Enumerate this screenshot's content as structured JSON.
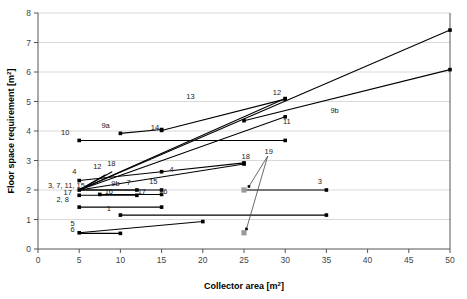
{
  "chart_data": {
    "type": "line",
    "title": "",
    "xlabel": "Collector area [m2]",
    "ylabel": "Floor space requirement [m2]",
    "xlabel_base": "Collector area [m",
    "xlabel_sup": "2",
    "xlabel_tail": "]",
    "ylabel_base": "Floor space requirement [m",
    "ylabel_sup": "2",
    "ylabel_tail": "]",
    "xlim": [
      0,
      50
    ],
    "ylim": [
      0,
      8
    ],
    "xticks": [
      0,
      5,
      10,
      15,
      20,
      25,
      30,
      35,
      40,
      45,
      50
    ],
    "yticks": [
      0,
      1,
      2,
      3,
      4,
      5,
      6,
      7,
      8
    ],
    "grid": "horizontal",
    "legend": "none",
    "marker_color": "#000000",
    "gray_marker_color": "#9a9a9a",
    "line_color": "#000000",
    "grid_color": "#d9d9d9",
    "series": [
      {
        "name": "1",
        "points": [
          [
            10,
            1.15
          ],
          [
            35,
            1.15
          ]
        ],
        "label": "1",
        "label_x": 8.6,
        "label_y": 1.3
      },
      {
        "name": "2, 8",
        "points": [
          [
            5,
            1.42
          ],
          [
            15,
            1.42
          ]
        ],
        "label": "2, 8",
        "label_x": 3.0,
        "label_y": 1.58
      },
      {
        "name": "3",
        "points": [
          [
            25,
            2.0
          ],
          [
            35,
            2.0
          ]
        ],
        "label": "3",
        "label_x": 34.2,
        "label_y": 2.22
      },
      {
        "name": "4a",
        "points": [
          [
            5,
            2.32
          ],
          [
            15,
            2.62
          ]
        ],
        "label": "4",
        "label_x": 4.4,
        "label_y": 2.55
      },
      {
        "name": "4b",
        "points": [
          [
            15,
            2.62
          ],
          [
            25,
            2.92
          ]
        ],
        "label": "4",
        "label_x": 16.2,
        "label_y": 2.62
      },
      {
        "name": "5",
        "points": [
          [
            5,
            0.55
          ],
          [
            20,
            0.93
          ]
        ],
        "label": "5",
        "label_x": 4.2,
        "label_y": 0.78
      },
      {
        "name": "6",
        "points": [
          [
            5,
            0.53
          ],
          [
            10,
            0.53
          ]
        ],
        "label": "6",
        "label_x": 4.2,
        "label_y": 0.58
      },
      {
        "name": "7",
        "points": [
          [
            5,
            2.0
          ],
          [
            12,
            2.0
          ]
        ],
        "label": "7",
        "label_x": 11.0,
        "label_y": 2.16
      },
      {
        "name": "9a",
        "points": [
          [
            10,
            3.92
          ],
          [
            15,
            4.05
          ]
        ],
        "label": "9a",
        "label_x": 8.2,
        "label_y": 4.1
      },
      {
        "name": "9b",
        "points": [
          [
            25,
            4.35
          ],
          [
            50,
            6.08
          ]
        ],
        "label": "9b",
        "label_x": 36.0,
        "label_y": 4.62
      },
      {
        "name": "10",
        "points": [
          [
            5,
            3.68
          ],
          [
            30,
            3.68
          ]
        ],
        "label": "10",
        "label_x": 3.3,
        "label_y": 3.86
      },
      {
        "name": "11",
        "points": [
          [
            5,
            2.0
          ],
          [
            30,
            4.48
          ]
        ],
        "label": "11",
        "label_x": 30.2,
        "label_y": 4.25
      },
      {
        "name": "12",
        "points": [
          [
            5,
            2.0
          ],
          [
            30,
            5.1
          ]
        ],
        "label": "12",
        "label_x": 29.0,
        "label_y": 5.22
      },
      {
        "name": "12b",
        "points": [
          [
            5,
            2.0
          ],
          [
            8.2,
            2.52
          ]
        ],
        "label": "12",
        "label_x": 7.2,
        "label_y": 2.72
      },
      {
        "name": "13",
        "points": [
          [
            5,
            2.0
          ],
          [
            50,
            7.42
          ]
        ],
        "label": "13",
        "label_x": 18.5,
        "label_y": 5.1
      },
      {
        "name": "14",
        "points": [
          [
            15,
            4.02
          ],
          [
            30,
            5.08
          ]
        ],
        "label": "14",
        "label_x": 14.2,
        "label_y": 4.02
      },
      {
        "name": "15",
        "points": [
          [
            5,
            2.0
          ],
          [
            15,
            2.0
          ]
        ],
        "label": "15",
        "label_x": 14.0,
        "label_y": 2.2
      },
      {
        "name": "16",
        "points": [
          [
            7.5,
            1.85
          ],
          [
            15,
            1.85
          ]
        ],
        "label": "16",
        "label_x": 15.2,
        "label_y": 1.88
      },
      {
        "name": "17",
        "points": [
          [
            5,
            1.82
          ],
          [
            12,
            1.82
          ]
        ],
        "label": "17",
        "label_x": 3.6,
        "label_y": 1.84
      },
      {
        "name": "18",
        "points": [
          [
            5,
            2.0
          ],
          [
            25,
            2.88
          ]
        ],
        "label": "18",
        "label_x": 8.9,
        "label_y": 2.8
      },
      {
        "name": "18b",
        "points": [
          [
            5,
            2.0
          ],
          [
            9.0,
            2.62
          ]
        ],
        "label": "18",
        "label_x": 25.2,
        "label_y": 3.05
      },
      {
        "name": "19a",
        "points": [
          [
            25,
            2.0
          ]
        ],
        "label": "",
        "label_x": 0,
        "label_y": 0
      },
      {
        "name": "19b",
        "points": [
          [
            25,
            0.55
          ]
        ],
        "label": "",
        "label_x": 0,
        "label_y": 0
      }
    ],
    "cluster_label": {
      "text": "3, 7, 11, 15",
      "x": 1.2,
      "y": 2.06
    },
    "label_16b": {
      "text": "16",
      "x": 8.6,
      "y": 1.86
    },
    "label_17b": {
      "text": "17",
      "x": 12.6,
      "y": 1.86
    },
    "label_9b_small": {
      "text": "9b",
      "x": 9.4,
      "y": 2.13
    },
    "callout": {
      "text": "19",
      "x": 28.0,
      "y": 3.22,
      "targets": [
        [
          25.6,
          2.12
        ],
        [
          25.3,
          0.68
        ]
      ]
    },
    "gray_markers": [
      [
        25,
        2.0
      ],
      [
        25,
        0.55
      ]
    ],
    "black_markers": [
      [
        10,
        1.15
      ],
      [
        35,
        1.15
      ],
      [
        5,
        1.42
      ],
      [
        15,
        1.42
      ],
      [
        25,
        2.0
      ],
      [
        35,
        2.0
      ],
      [
        5,
        2.32
      ],
      [
        15,
        2.62
      ],
      [
        25,
        2.92
      ],
      [
        5,
        0.55
      ],
      [
        20,
        0.93
      ],
      [
        10,
        0.53
      ],
      [
        12,
        2.0
      ],
      [
        10,
        3.92
      ],
      [
        15,
        4.05
      ],
      [
        25,
        4.35
      ],
      [
        50,
        6.08
      ],
      [
        5,
        3.68
      ],
      [
        30,
        3.68
      ],
      [
        30,
        4.48
      ],
      [
        30,
        5.1
      ],
      [
        50,
        7.42
      ],
      [
        15,
        4.02
      ],
      [
        30,
        5.08
      ],
      [
        15,
        2.0
      ],
      [
        7.5,
        1.85
      ],
      [
        15,
        1.85
      ],
      [
        5,
        1.82
      ],
      [
        12,
        1.82
      ],
      [
        25,
        2.88
      ],
      [
        5,
        2.0
      ]
    ]
  }
}
